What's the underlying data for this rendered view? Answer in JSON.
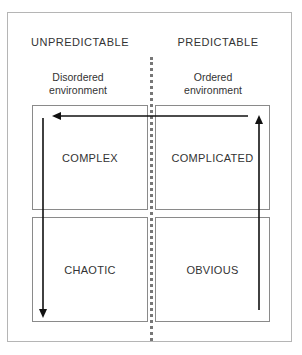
{
  "columns": {
    "left": {
      "heading": "UNPREDICTABLE",
      "subheading": "Disordered environment"
    },
    "right": {
      "heading": "PREDICTABLE",
      "subheading": "Ordered environment"
    }
  },
  "quadrants": {
    "top_left": "COMPLEX",
    "top_right": "COMPLICATED",
    "bottom_left": "CHAOTIC",
    "bottom_right": "OBVIOUS"
  },
  "arrows": [
    {
      "name": "up-arrow",
      "from": "OBVIOUS",
      "to": "COMPLICATED",
      "direction": "up"
    },
    {
      "name": "left-arrow",
      "from": "COMPLICATED",
      "to": "COMPLEX",
      "direction": "left"
    },
    {
      "name": "down-arrow",
      "from": "COMPLEX",
      "to": "CHAOTIC",
      "direction": "down"
    }
  ],
  "colors": {
    "arrow": "#111111",
    "box_border": "#8a8a8a",
    "frame_border": "#b5b5b5",
    "divider": "#777777"
  }
}
